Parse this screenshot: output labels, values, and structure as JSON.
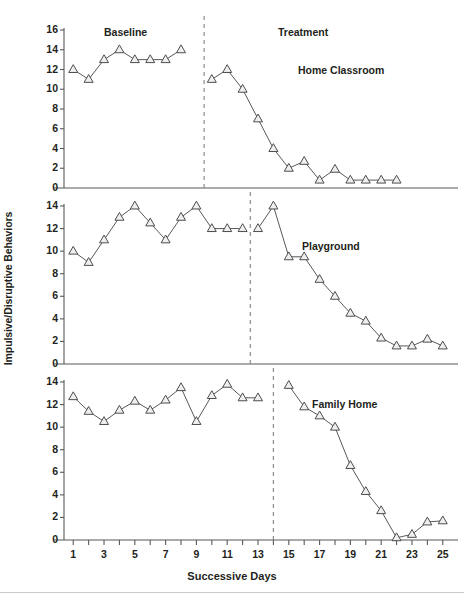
{
  "figure": {
    "xlabel": "Successive Days",
    "ylabel": "Impulsive/Disruptive Behaviors",
    "phase_labels": {
      "baseline": "Baseline",
      "treatment": "Treatment"
    },
    "x_ticks": [
      1,
      2,
      3,
      4,
      5,
      6,
      7,
      8,
      9,
      10,
      11,
      12,
      13,
      14,
      15,
      16,
      17,
      18,
      19,
      20,
      21,
      22,
      23,
      24,
      25
    ],
    "x_tick_labels": [
      "1",
      "",
      "3",
      "",
      "5",
      "",
      "7",
      "",
      "9",
      "",
      "11",
      "",
      "13",
      "",
      "15",
      "",
      "17",
      "",
      "19",
      "",
      "21",
      "",
      "23",
      "",
      "25"
    ],
    "marker": "open-triangle",
    "line_color": "#595959",
    "marker_fill": "#efefef",
    "marker_edge": "#4d4d4d",
    "axis_color": "#595959",
    "phase_line_color": "#8c8c8c"
  },
  "chart_data": {
    "type": "line",
    "title": "",
    "xlabel": "Successive Days",
    "ylabel": "Impulsive/Disruptive Behaviors",
    "xlim": [
      0.4,
      25.6
    ],
    "grid": false,
    "legend": "none",
    "panels": [
      {
        "name": "Home Classroom",
        "label": "Home Classroom",
        "ylim": [
          0,
          16
        ],
        "y_ticks": [
          0,
          2,
          4,
          6,
          8,
          10,
          12,
          14,
          16
        ],
        "phase_line_x": 9.5,
        "phase_labels": [
          "Baseline",
          "Treatment"
        ],
        "series": [
          {
            "name": "Baseline",
            "x": [
              1,
              2,
              3,
              4,
              5,
              6,
              7,
              8
            ],
            "values": [
              12,
              11,
              13,
              14,
              13,
              13,
              13,
              14
            ]
          },
          {
            "name": "Treatment",
            "x": [
              10,
              11,
              12,
              13,
              14,
              15,
              16,
              17,
              18,
              19,
              20,
              21,
              22
            ],
            "values": [
              11,
              12,
              10,
              7,
              4,
              2,
              2.7,
              0.8,
              1.9,
              0.8,
              0.8,
              0.8,
              0.8
            ]
          }
        ]
      },
      {
        "name": "Playground",
        "label": "Playground",
        "ylim": [
          0,
          14
        ],
        "y_ticks": [
          0,
          2,
          4,
          6,
          8,
          10,
          12,
          14
        ],
        "phase_line_x": 12.5,
        "series": [
          {
            "name": "Baseline",
            "x": [
              1,
              2,
              3,
              4,
              5,
              6,
              7,
              8,
              9,
              10,
              11,
              12
            ],
            "values": [
              10,
              9,
              11,
              13,
              14,
              12.5,
              11,
              13,
              14,
              12,
              12,
              12
            ]
          },
          {
            "name": "Treatment",
            "x": [
              13,
              14,
              15,
              16,
              17,
              18,
              19,
              20,
              21,
              22,
              23,
              24,
              25
            ],
            "values": [
              12,
              14,
              9.5,
              9.5,
              7.5,
              6,
              4.5,
              3.8,
              2.3,
              1.6,
              1.6,
              2.2,
              1.6
            ]
          }
        ]
      },
      {
        "name": "Family Home",
        "label": "Family Home",
        "ylim": [
          0,
          14
        ],
        "y_ticks": [
          0,
          2,
          4,
          6,
          8,
          10,
          12,
          14
        ],
        "phase_line_x": 14,
        "series": [
          {
            "name": "Baseline",
            "x": [
              1,
              2,
              3,
              4,
              5,
              6,
              7,
              8,
              9,
              10,
              11,
              12,
              13
            ],
            "values": [
              12.7,
              11.4,
              10.5,
              11.5,
              12.3,
              11.5,
              12.4,
              13.5,
              10.5,
              12.8,
              13.8,
              12.6,
              12.6
            ]
          },
          {
            "name": "Treatment",
            "x": [
              15,
              16,
              17,
              18,
              19,
              20,
              21,
              22,
              23,
              24,
              25
            ],
            "values": [
              13.7,
              11.8,
              11,
              10,
              6.6,
              4.3,
              2.6,
              0.2,
              0.5,
              1.6,
              1.7
            ]
          }
        ]
      }
    ]
  }
}
